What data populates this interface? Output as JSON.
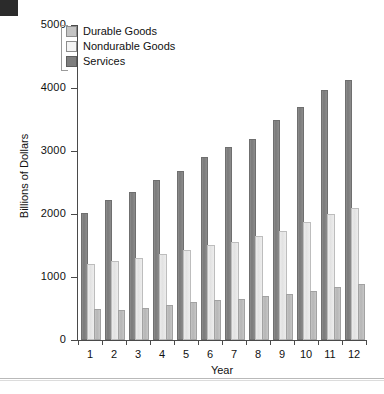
{
  "chart_data": {
    "type": "bar",
    "title": "",
    "xlabel": "Year",
    "ylabel": "Billions of Dollars",
    "categories": [
      "1",
      "2",
      "3",
      "4",
      "5",
      "6",
      "7",
      "8",
      "9",
      "10",
      "11",
      "12"
    ],
    "ylim": [
      0,
      5000
    ],
    "yticks": [
      0,
      1000,
      2000,
      3000,
      4000,
      5000
    ],
    "ytick_labels": [
      "0",
      "1000",
      "2000",
      "3000",
      "4000",
      "5000"
    ],
    "grid": false,
    "legend_position": "top-left",
    "bar_order_in_group": [
      "Services",
      "Nondurable Goods",
      "Durable Goods"
    ],
    "series": [
      {
        "name": "Durable Goods",
        "color": "#c4c4c4",
        "values": [
          460,
          440,
          470,
          520,
          570,
          600,
          620,
          660,
          700,
          750,
          805,
          860
        ]
      },
      {
        "name": "Nondurable Goods",
        "color": "#ebebeb",
        "values": [
          1175,
          1225,
          1265,
          1330,
          1390,
          1480,
          1530,
          1615,
          1705,
          1835,
          1975,
          2060
        ]
      },
      {
        "name": "Services",
        "color": "#7e7e7e",
        "values": [
          1990,
          2185,
          2320,
          2510,
          2655,
          2880,
          3035,
          3165,
          3460,
          3660,
          3930,
          4100
        ]
      }
    ]
  },
  "legend": {
    "items": [
      {
        "label": "Durable Goods",
        "swatch": "durable"
      },
      {
        "label": "Nondurable Goods",
        "swatch": "nondurable"
      },
      {
        "label": "Services",
        "swatch": "services"
      }
    ]
  },
  "axes": {
    "y_title": "Billions of Dollars",
    "x_title": "Year"
  }
}
